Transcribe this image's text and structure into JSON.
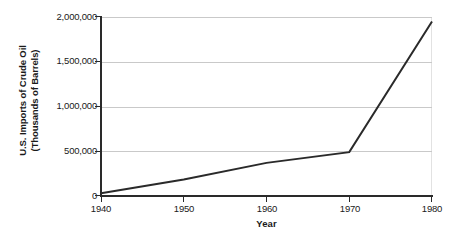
{
  "chart_data": {
    "type": "line",
    "title": "",
    "xlabel": "Year",
    "ylabel": "U.S. Imports of Crude Oil (Thousands of Barrels)",
    "ylabel_line1": "U.S. Imports of Crude Oil",
    "ylabel_line2": "(Thousands of Barrels)",
    "xlim": [
      1940,
      1980
    ],
    "ylim": [
      0,
      2000000
    ],
    "grid": true,
    "legend": "none",
    "x_ticks": [
      1940,
      1950,
      1960,
      1970,
      1980
    ],
    "x_tick_labels": [
      "1940",
      "1950",
      "1960",
      "1970",
      "1980"
    ],
    "y_ticks": [
      0,
      500000,
      1000000,
      1500000,
      2000000
    ],
    "y_tick_labels": [
      "0",
      "500,000",
      "1,000,000",
      "1,500,000",
      "2,000,000"
    ],
    "series": [
      {
        "name": "U.S. Imports of Crude Oil",
        "color": "#2a2a2a",
        "x": [
          1940,
          1950,
          1960,
          1970,
          1980
        ],
        "values": [
          30000,
          185000,
          370000,
          490000,
          1950000
        ]
      }
    ]
  },
  "axis": {
    "line_color": "#2a2a2a",
    "grid_color": "#c9c9c9",
    "frame_color": "#e2e2e2"
  },
  "background": "#ffffff"
}
